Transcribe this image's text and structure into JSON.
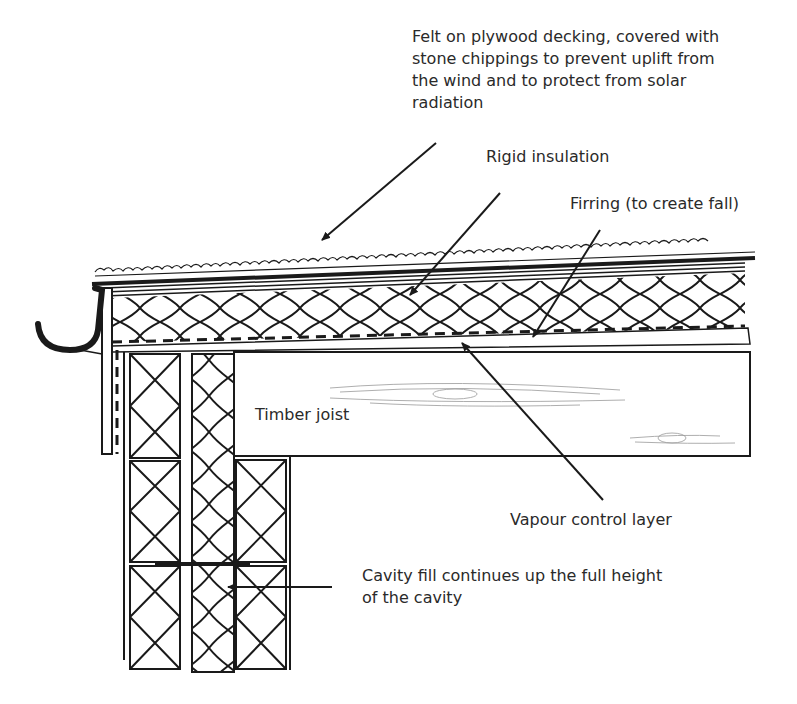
{
  "diagram": {
    "type": "flat roof eaves construction detail (cross-section)",
    "labels": {
      "felt": "Felt on plywood decking, covered with\nstone chippings to prevent uplift from\nthe wind and to protect from solar\nradiation",
      "rigid_insulation": "Rigid insulation",
      "firring": "Firring (to create fall)",
      "timber_joist": "Timber joist",
      "vapour_control": "Vapour control layer",
      "cavity_fill": "Cavity fill continues up the full height\nof the cavity"
    },
    "components": [
      "stone chippings",
      "felt on plywood decking",
      "rigid insulation",
      "firring",
      "vapour control layer",
      "timber joist",
      "gutter",
      "fascia board",
      "inner leaf blockwork",
      "cavity fill insulation",
      "outer leaf blockwork",
      "wall tie"
    ],
    "colors": {
      "line": "#1a1a1a",
      "text": "#2a2a2a",
      "background": "#ffffff"
    }
  }
}
